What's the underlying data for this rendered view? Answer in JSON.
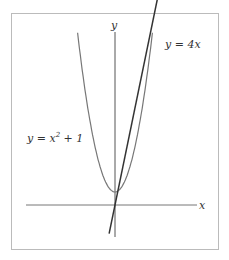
{
  "figure": {
    "axis_labels": {
      "x": "x",
      "y": "y"
    },
    "curves": [
      {
        "name": "parabola",
        "equation_prefix": "y = x",
        "equation_exp": "2",
        "equation_suffix": " + 1",
        "color": "#777777"
      },
      {
        "name": "line",
        "equation": "y = 4x",
        "color": "#333333"
      }
    ],
    "x_range": [
      -3.5,
      3.5
    ],
    "frame_color": "#bbbbbb"
  },
  "chart_data": {
    "type": "line",
    "title": "",
    "xlabel": "x",
    "ylabel": "y",
    "series": [
      {
        "name": "y = x^2 + 1",
        "function": "x^2+1"
      },
      {
        "name": "y = 4x",
        "function": "4x"
      }
    ]
  }
}
